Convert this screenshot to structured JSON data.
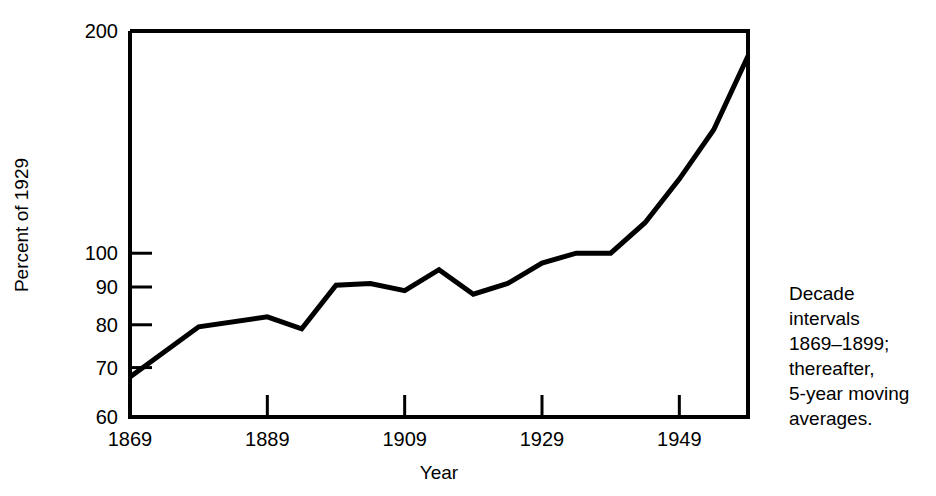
{
  "chart_data": {
    "type": "line",
    "title": "",
    "xlabel": "Year",
    "ylabel": "Percent of 1929",
    "yscale": "log",
    "xlim": [
      1869,
      1959
    ],
    "ylim": [
      60,
      200
    ],
    "grid": false,
    "legend": null,
    "ytick_labels": [
      "200",
      "100",
      "90",
      "80",
      "70",
      "60"
    ],
    "yticks": [
      200,
      100,
      90,
      80,
      70,
      60
    ],
    "xtick_labels": [
      "1869",
      "1889",
      "1909",
      "1929",
      "1949"
    ],
    "xticks": [
      1869,
      1889,
      1909,
      1929,
      1949
    ],
    "annotation": "Decade intervals 1869-1899; thereafter, 5-year moving averages.",
    "series": [
      {
        "name": "Percent of 1929",
        "x": [
          1869,
          1879,
          1889,
          1894,
          1899,
          1904,
          1909,
          1914,
          1919,
          1924,
          1929,
          1934,
          1939,
          1944,
          1949,
          1954,
          1959
        ],
        "values": [
          68,
          79.5,
          82,
          79,
          90.5,
          91,
          89,
          95,
          88,
          91,
          97,
          100,
          100,
          110,
          126,
          147,
          185
        ]
      }
    ]
  },
  "annotation_lines": [
    "Decade",
    "intervals",
    "1869–1899;",
    "thereafter,",
    "5-year moving",
    "averages."
  ],
  "axis_titles": {
    "x": "Year",
    "y": "Percent of 1929"
  }
}
